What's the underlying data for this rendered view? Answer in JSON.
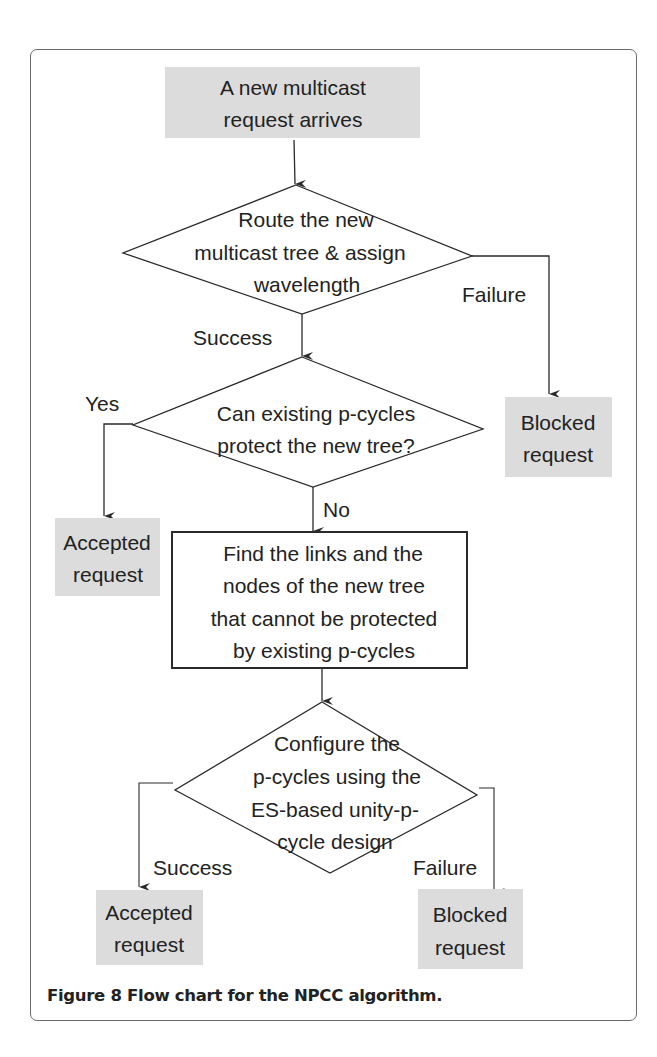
{
  "figure": {
    "caption_label": "Figure 8",
    "caption_text": " Flow chart for the NPCC algorithm."
  },
  "colors": {
    "terminal_fill": "#dcdcdc",
    "stroke": "#2a2a2a",
    "text": "#222222",
    "frame": "#6a6a6a"
  },
  "nodes": {
    "start": {
      "type": "terminal",
      "lines": [
        "A new multicast",
        "request arrives"
      ]
    },
    "route_decision": {
      "type": "decision",
      "lines": [
        "Route the new",
        "multicast tree & assign",
        "wavelength"
      ]
    },
    "blocked_1": {
      "type": "terminal",
      "lines": [
        "Blocked",
        "request"
      ]
    },
    "protect_decision": {
      "type": "decision",
      "lines": [
        "Can existing p-cycles",
        "protect the new tree?"
      ]
    },
    "accepted_1": {
      "type": "terminal",
      "lines": [
        "Accepted",
        "request"
      ]
    },
    "find_links": {
      "type": "process",
      "lines": [
        "Find the links and the",
        "nodes of the new tree",
        "that cannot be protected",
        "by existing p-cycles"
      ]
    },
    "configure_decision": {
      "type": "decision",
      "lines": [
        "Configure the",
        "p-cycles using the",
        "ES-based unity-p-",
        "cycle design"
      ]
    },
    "accepted_2": {
      "type": "terminal",
      "lines": [
        "Accepted",
        "request"
      ]
    },
    "blocked_2": {
      "type": "terminal",
      "lines": [
        "Blocked",
        "request"
      ]
    }
  },
  "edges": {
    "route_failure": "Failure",
    "route_success": "Success",
    "protect_yes": "Yes",
    "protect_no": "No",
    "configure_success": "Success",
    "configure_failure": "Failure"
  }
}
